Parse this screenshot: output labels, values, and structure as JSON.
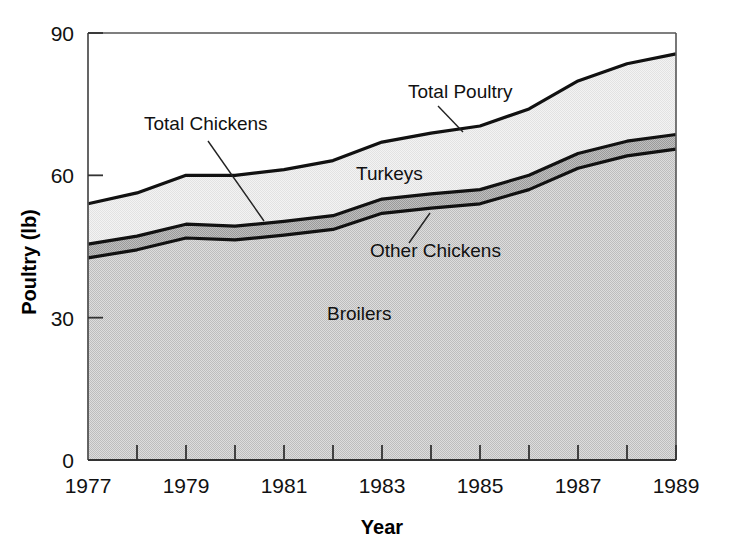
{
  "chart_data": {
    "type": "area",
    "title": "",
    "subtitle": "",
    "xlabel": "Year",
    "ylabel": "Poultry (lb)",
    "xlim": [
      1977,
      1989
    ],
    "ylim": [
      0,
      90
    ],
    "grid": false,
    "stacked": true,
    "legend_position": "inline-annotations",
    "x": [
      1977,
      1978,
      1979,
      1980,
      1981,
      1982,
      1983,
      1984,
      1985,
      1986,
      1987,
      1988,
      1989
    ],
    "y_ticks": [
      "0",
      "30",
      "60",
      "90"
    ],
    "y_tick_values": [
      0,
      30,
      60,
      90
    ],
    "x_ticks": [
      "1977",
      "1979",
      "1981",
      "1983",
      "1985",
      "1987",
      "1989"
    ],
    "x_tick_values": [
      1977,
      1979,
      1981,
      1983,
      1985,
      1987,
      1989
    ],
    "x_minor_ticks": [
      1978,
      1980,
      1982,
      1984,
      1986,
      1988
    ],
    "series": [
      {
        "name": "Broilers",
        "color": "#d2d2d2",
        "values": [
          42.6,
          44.3,
          46.8,
          46.4,
          47.4,
          48.6,
          52.0,
          53.1,
          54.0,
          57.0,
          61.5,
          64.1,
          65.5
        ]
      },
      {
        "name": "Other Chickens",
        "color": "#b2b2b2",
        "values": [
          2.9,
          2.9,
          2.9,
          2.9,
          2.9,
          2.9,
          3.0,
          3.0,
          3.0,
          3.0,
          3.1,
          3.1,
          3.1
        ]
      },
      {
        "name": "Turkeys",
        "color": "#ededed",
        "values": [
          8.5,
          9.1,
          10.3,
          10.7,
          10.9,
          11.6,
          12.0,
          12.8,
          13.4,
          14.0,
          15.3,
          16.3,
          17.0
        ]
      }
    ],
    "cumulative_boundaries": {
      "total_chickens": [
        45.5,
        47.2,
        49.7,
        49.3,
        50.3,
        51.5,
        55.0,
        56.1,
        57.0,
        60.0,
        64.6,
        67.2,
        68.6
      ],
      "total_poultry": [
        54.0,
        56.3,
        60.0,
        60.0,
        61.2,
        63.1,
        67.0,
        68.9,
        70.4,
        74.0,
        79.9,
        83.5,
        85.6
      ]
    },
    "annotations": [
      {
        "name": "total-poultry",
        "text": "Total Poultry",
        "x_px": 408,
        "y_px": 98,
        "leader_from": [
          438,
          106
        ],
        "leader_to": [
          463,
          132
        ]
      },
      {
        "name": "total-chickens",
        "text": "Total Chickens",
        "x_px": 144,
        "y_px": 130,
        "leader_from": [
          208,
          141
        ],
        "leader_to": [
          264,
          221
        ]
      },
      {
        "name": "turkeys",
        "text": "Turkeys",
        "x_px": 356,
        "y_px": 180,
        "leader_from": null,
        "leader_to": null
      },
      {
        "name": "other-chickens",
        "text": "Other Chickens",
        "x_px": 370,
        "y_px": 257,
        "leader_from": [
          409,
          243
        ],
        "leader_to": [
          430,
          213
        ]
      },
      {
        "name": "broilers",
        "text": "Broilers",
        "x_px": 327,
        "y_px": 320,
        "leader_from": null,
        "leader_to": null
      }
    ]
  },
  "axes": {
    "y_title": "Poultry (lb)",
    "x_title": "Year"
  }
}
